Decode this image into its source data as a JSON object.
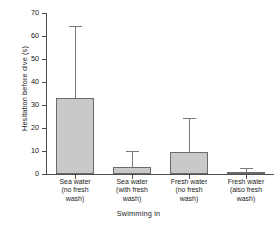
{
  "chart_data": {
    "type": "bar",
    "title": "",
    "xlabel": "Swimming in",
    "ylabel": "Hesitation before dive (s)",
    "ylim": [
      0,
      70
    ],
    "yticks": [
      0,
      10,
      20,
      30,
      40,
      50,
      60,
      70
    ],
    "ytick_labels": [
      "0",
      "10",
      "20",
      "30",
      "40",
      "50",
      "60",
      "70"
    ],
    "grid": false,
    "legend": null,
    "categories": [
      "Sea water (no fresh wash)",
      "Sea water (with fresh wash)",
      "Fresh water (no fresh wash)",
      "Fresh water (also fresh wash)"
    ],
    "category_lines": [
      [
        "Sea water",
        "(no fresh",
        "wash)"
      ],
      [
        "Sea water",
        "(with fresh",
        "wash)"
      ],
      [
        "Fresh water",
        "(no fresh",
        "wash)"
      ],
      [
        "Fresh water",
        "(also fresh",
        "wash)"
      ]
    ],
    "values": [
      33,
      3,
      9.5,
      0.8
    ],
    "error_upper": [
      64.5,
      10,
      24.5,
      2.5
    ],
    "bar_fill_color": "#c9c9c9",
    "bar_edge_color": "#6b6b6b",
    "axis_color": "#4d4d4d",
    "error_bar_color": "#7a7a7a"
  }
}
